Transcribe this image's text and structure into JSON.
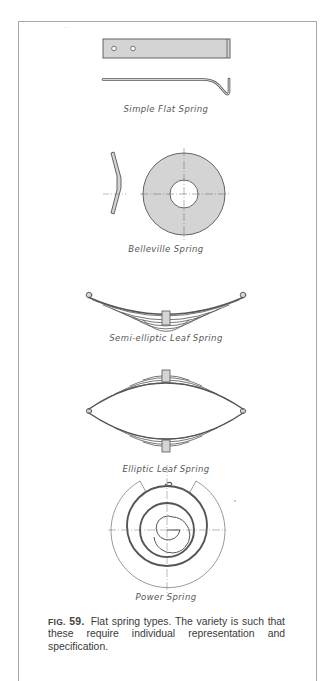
{
  "figure": {
    "number_label": "FIG.",
    "number": "59.",
    "caption": "Flat spring types. The variety is such that these require individual representation and specification.",
    "colors": {
      "fill": "#d4d4d4",
      "line": "#555555",
      "frame": "#a8a8a8",
      "background": "#ffffff"
    },
    "items": [
      {
        "id": "simple-flat",
        "label": "Simple Flat Spring"
      },
      {
        "id": "belleville",
        "label": "Belleville Spring"
      },
      {
        "id": "semi-elliptic",
        "label": "Semi-elliptic Leaf Spring"
      },
      {
        "id": "elliptic",
        "label": "Elliptic Leaf Spring"
      },
      {
        "id": "power",
        "label": "Power Spring"
      }
    ]
  }
}
